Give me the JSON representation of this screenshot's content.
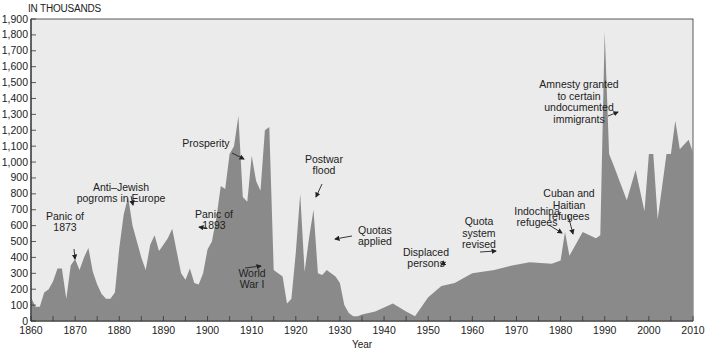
{
  "chart_data": {
    "type": "area",
    "title": "",
    "units_label": "IN THOUSANDS",
    "xlabel": "Year",
    "ylabel": "",
    "xlim": [
      1860,
      2010
    ],
    "ylim": [
      0,
      1900
    ],
    "grid": false,
    "legend": null,
    "colors": {
      "fill": "#8a8a8a",
      "plot_bg": "#ebebeb",
      "axis": "#333333",
      "text": "#222222"
    },
    "x_ticks": [
      1860,
      1870,
      1880,
      1890,
      1900,
      1910,
      1920,
      1930,
      1940,
      1950,
      1960,
      1970,
      1980,
      1990,
      2000,
      2010
    ],
    "y_ticks": [
      0,
      100,
      200,
      300,
      400,
      500,
      600,
      700,
      800,
      900,
      1000,
      1100,
      1200,
      1300,
      1400,
      1500,
      1600,
      1700,
      1800,
      1900
    ],
    "y_tick_labels": [
      "0",
      "100",
      "200",
      "300",
      "400",
      "500",
      "600",
      "700",
      "800",
      "900",
      "1,000",
      "1,100",
      "1,200",
      "1,300",
      "1,400",
      "1,500",
      "1,600",
      "1,700",
      "1,800",
      "1,900"
    ],
    "series": [
      {
        "name": "Immigrants",
        "x": [
          1860,
          1861,
          1862,
          1863,
          1864,
          1865,
          1866,
          1867,
          1868,
          1869,
          1870,
          1871,
          1872,
          1873,
          1874,
          1875,
          1876,
          1877,
          1878,
          1879,
          1880,
          1881,
          1882,
          1883,
          1884,
          1885,
          1886,
          1887,
          1888,
          1889,
          1890,
          1891,
          1892,
          1893,
          1894,
          1895,
          1896,
          1897,
          1898,
          1899,
          1900,
          1901,
          1902,
          1903,
          1904,
          1905,
          1906,
          1907,
          1908,
          1909,
          1910,
          1911,
          1912,
          1913,
          1914,
          1915,
          1916,
          1917,
          1918,
          1919,
          1920,
          1921,
          1922,
          1923,
          1924,
          1925,
          1926,
          1927,
          1928,
          1929,
          1930,
          1931,
          1932,
          1933,
          1934,
          1935,
          1938,
          1942,
          1945,
          1947,
          1950,
          1953,
          1956,
          1960,
          1965,
          1969,
          1973,
          1978,
          1980,
          1981,
          1982,
          1985,
          1988,
          1989,
          1990,
          1991,
          1992,
          1995,
          1997,
          1999,
          2000,
          2001,
          2002,
          2004,
          2005,
          2006,
          2007,
          2008,
          2009,
          2010
        ],
        "values": [
          150,
          90,
          90,
          180,
          200,
          250,
          330,
          330,
          140,
          350,
          390,
          320,
          400,
          460,
          310,
          230,
          170,
          140,
          140,
          180,
          460,
          670,
          780,
          600,
          500,
          400,
          320,
          480,
          540,
          440,
          480,
          520,
          580,
          440,
          300,
          260,
          330,
          240,
          230,
          300,
          450,
          500,
          650,
          850,
          830,
          1050,
          1100,
          1290,
          780,
          750,
          1040,
          880,
          820,
          1200,
          1220,
          320,
          300,
          280,
          110,
          140,
          430,
          800,
          310,
          520,
          700,
          300,
          290,
          320,
          300,
          280,
          240,
          100,
          50,
          30,
          30,
          40,
          60,
          110,
          60,
          30,
          150,
          220,
          240,
          300,
          320,
          350,
          370,
          360,
          380,
          560,
          410,
          560,
          520,
          540,
          1820,
          1050,
          980,
          760,
          950,
          690,
          1050,
          1050,
          640,
          1050,
          1050,
          1260,
          1080,
          1110,
          1140,
          1060
        ]
      }
    ],
    "annotations": [
      {
        "text": "Panic of 1873",
        "lines": [
          "Panic of",
          "1873"
        ],
        "year": 1873,
        "value": 380
      },
      {
        "text": "Anti-Jewish pogroms in Europe",
        "lines": [
          "Anti–Jewish",
          "pogroms in Europe"
        ],
        "year": 1883,
        "value": 780
      },
      {
        "text": "Panic of 1893",
        "lines": [
          "Panic of",
          "1893"
        ],
        "year": 1893,
        "value": 580
      },
      {
        "text": "Prosperity",
        "lines": [
          "Prosperity"
        ],
        "year": 1907,
        "value": 1050
      },
      {
        "text": "World War I",
        "lines": [
          "World",
          "War I"
        ],
        "year": 1916,
        "value": 420
      },
      {
        "text": "Postwar flood",
        "lines": [
          "Postwar",
          "flood"
        ],
        "year": 1924,
        "value": 740
      },
      {
        "text": "Quotas applied",
        "lines": [
          "Quotas",
          "applied"
        ],
        "year": 1926,
        "value": 560
      },
      {
        "text": "Displaced persons",
        "lines": [
          "Displaced",
          "persons"
        ],
        "year": 1952,
        "value": 220
      },
      {
        "text": "Quota system revised",
        "lines": [
          "Quota",
          "system",
          "revised"
        ],
        "year": 1965,
        "value": 290
      },
      {
        "text": "Indochina refugees",
        "lines": [
          "Indochina",
          "refugees"
        ],
        "year": 1979,
        "value": 420
      },
      {
        "text": "Cuban and Haitian refugees",
        "lines": [
          "Cuban and",
          "Haitian",
          "refugees"
        ],
        "year": 1984,
        "value": 560
      },
      {
        "text": "Amnesty granted to certain undocumented immigrants",
        "lines": [
          "Amnesty granted",
          "to certain",
          "undocumented",
          "immigrants"
        ],
        "year": 1989,
        "value": 1470
      }
    ]
  }
}
